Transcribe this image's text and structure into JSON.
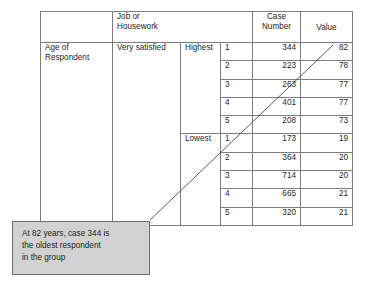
{
  "table": {
    "headers": {
      "blank": "",
      "group_span": "Job or\nHousework",
      "group_span_line1": "Job or",
      "group_span_line2": "Housework",
      "case_number_line1": "Case",
      "case_number_line2": "Number",
      "value": "Value"
    },
    "row_labels": {
      "variable_line1": "Age of",
      "variable_line2": "Respondent",
      "category": "Very satisfied",
      "highest": "Highest",
      "lowest": "Lowest"
    },
    "groups": [
      {
        "label": "Highest",
        "rows": [
          {
            "rank": "1",
            "case_number": "344",
            "value": "82",
            "emphasis": true
          },
          {
            "rank": "2",
            "case_number": "223",
            "value": "78",
            "emphasis": false
          },
          {
            "rank": "3",
            "case_number": "263",
            "value": "77",
            "emphasis": false
          },
          {
            "rank": "4",
            "case_number": "401",
            "value": "77",
            "emphasis": false
          },
          {
            "rank": "5",
            "case_number": "208",
            "value": "73",
            "emphasis": false
          }
        ]
      },
      {
        "label": "Lowest",
        "rows": [
          {
            "rank": "1",
            "case_number": "173",
            "value": "19",
            "emphasis": false
          },
          {
            "rank": "2",
            "case_number": "364",
            "value": "20",
            "emphasis": false
          },
          {
            "rank": "3",
            "case_number": "714",
            "value": "20",
            "emphasis": false
          },
          {
            "rank": "4",
            "case_number": "665",
            "value": "21",
            "emphasis": false
          },
          {
            "rank": "5",
            "case_number": "320",
            "value": "21",
            "emphasis": false
          }
        ]
      }
    ]
  },
  "callout": {
    "line1": "At 82 years, case 344 is",
    "line2": "the oldest respondent",
    "line3": "in the group",
    "fill_color": "#d2d2d2",
    "border_color": "#6e6e6e"
  },
  "leader_line": {
    "color": "#4a4a4a",
    "from_x": 333,
    "from_y": 45,
    "to_x": 150,
    "to_y": 220
  }
}
